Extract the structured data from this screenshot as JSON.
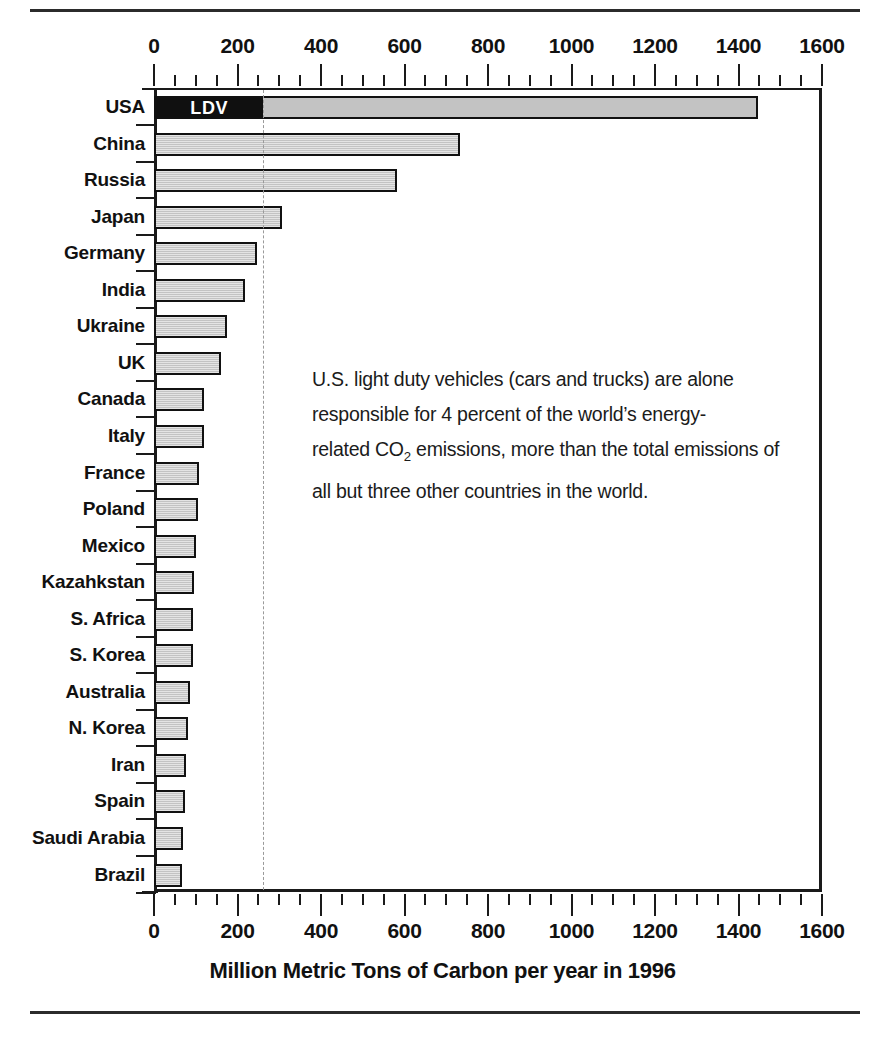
{
  "caption": "Million Metric Tons of Carbon per year in 1996",
  "annotation": {
    "lines": [
      "U.S. light duty vehicles (cars and trucks) are alone",
      "responsible for 4 percent of the world’s energy-",
      "related CO₂ emissions, more than the total emissions of",
      "all but three other countries in the world."
    ]
  },
  "ldv_label": "LDV",
  "chart_data": {
    "type": "bar",
    "orientation": "horizontal",
    "title": "",
    "subtitle": "",
    "xlabel": "Million Metric Tons of Carbon per year in 1996",
    "ylabel": "",
    "xlim": [
      0,
      1600
    ],
    "xticks": [
      0,
      200,
      400,
      600,
      800,
      1000,
      1200,
      1400,
      1600
    ],
    "xtick_labels": [
      "0",
      "200",
      "400",
      "600",
      "800",
      "1000",
      "1200",
      "1400",
      "1600"
    ],
    "minor_tick_interval": 50,
    "grid": false,
    "legend": "none",
    "axis_positions": [
      "top",
      "bottom"
    ],
    "bar_color": "#c3c3c3",
    "bar_edge_color": "#111111",
    "highlight_color": "#101010",
    "reference_line": {
      "value": 260,
      "style": "dashed",
      "color": "#9a9a9a",
      "label": "U.S. light duty vehicle emissions"
    },
    "categories": [
      "USA",
      "China",
      "Russia",
      "Japan",
      "Germany",
      "India",
      "Ukraine",
      "UK",
      "Canada",
      "Italy",
      "France",
      "Poland",
      "Mexico",
      "Kazahkstan",
      "S. Africa",
      "S. Korea",
      "Australia",
      "N. Korea",
      "Iran",
      "Spain",
      "Saudi Arabia",
      "Brazil"
    ],
    "values": [
      1447,
      733,
      582,
      306,
      246,
      218,
      175,
      160,
      120,
      119,
      108,
      105,
      101,
      97,
      94,
      93,
      86,
      82,
      77,
      74,
      70,
      68
    ],
    "segments": [
      {
        "category": "USA",
        "name": "LDV",
        "label": "LDV",
        "value": 260,
        "color": "#101010",
        "text_color": "#ffffff"
      }
    ]
  }
}
